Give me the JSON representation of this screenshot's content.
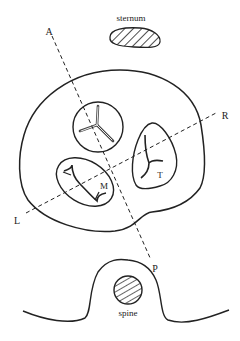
{
  "diagram": {
    "type": "anatomical cross-section",
    "labels": {
      "sternum": "sternum",
      "spine": "spine",
      "axis_anterior": "A",
      "axis_posterior": "P",
      "axis_left": "L",
      "axis_right": "R",
      "tricuspid": "T",
      "mitral": "M"
    },
    "structures": [
      {
        "id": "sternum",
        "shape": "hatched ellipse",
        "position": "top"
      },
      {
        "id": "heart-outline",
        "shape": "closed contour",
        "position": "center"
      },
      {
        "id": "aortic-valve",
        "shape": "circle with three-leaflet star",
        "position": "upper center"
      },
      {
        "id": "tricuspid-valve",
        "shape": "rounded triangle with leaflets",
        "label": "T"
      },
      {
        "id": "mitral-valve",
        "shape": "ellipse with two leaflets",
        "label": "M"
      },
      {
        "id": "spine",
        "shape": "hatched circle within body contour bump",
        "position": "bottom"
      }
    ],
    "axes": [
      {
        "from": "A",
        "to": "P",
        "style": "dashed"
      },
      {
        "from": "L",
        "to": "R",
        "style": "dashed"
      }
    ],
    "colors": {
      "stroke": "#222222",
      "background": "#ffffff"
    }
  }
}
